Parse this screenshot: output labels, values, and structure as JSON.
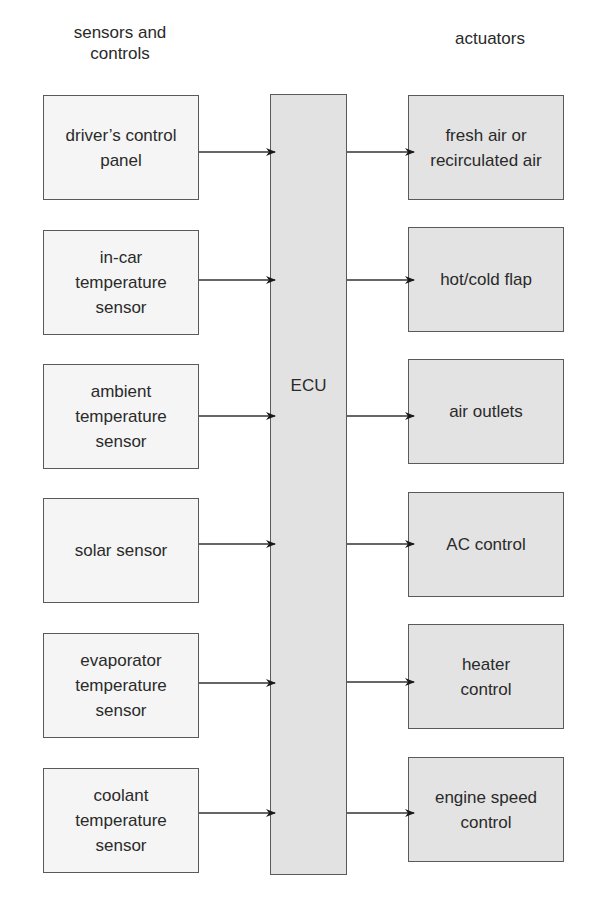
{
  "headings": {
    "left": "sensors and\ncontrols",
    "right": "actuators"
  },
  "ecu": {
    "label": "ECU"
  },
  "sensors": [
    {
      "label": "driver’s control\npanel"
    },
    {
      "label": "in-car\ntemperature\nsensor"
    },
    {
      "label": "ambient\ntemperature\nsensor"
    },
    {
      "label": "solar sensor"
    },
    {
      "label": "evaporator\ntemperature\nsensor"
    },
    {
      "label": "coolant\ntemperature\nsensor"
    }
  ],
  "actuators": [
    {
      "label": "fresh air or\nrecirculated air"
    },
    {
      "label": "hot/cold flap"
    },
    {
      "label": "air outlets"
    },
    {
      "label": "AC control"
    },
    {
      "label": "heater\ncontrol"
    },
    {
      "label": "engine speed\ncontrol"
    }
  ],
  "colors": {
    "sensor_fill": "#f5f5f5",
    "actuator_fill": "#e3e3e3",
    "ecu_fill": "#e2e2e2",
    "stroke": "#5a5a5a"
  }
}
